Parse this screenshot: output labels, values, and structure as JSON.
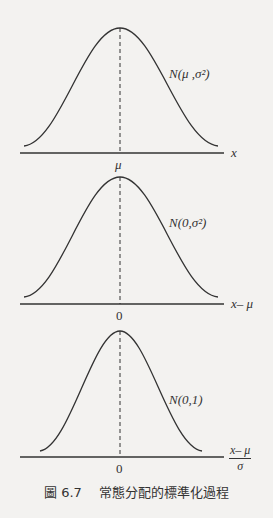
{
  "panels": [
    {
      "dist_label": "N(μ ,σ²)",
      "center_label": "μ",
      "axis_label": "x"
    },
    {
      "dist_label": "N(0,σ²)",
      "center_label": "0",
      "axis_label": "x– μ"
    },
    {
      "dist_label": "N(0,1)",
      "center_label": "0",
      "axis_label_num": "x– μ",
      "axis_label_den": "σ"
    }
  ],
  "caption": "圖 6.7　 常態分配的標準化過程",
  "colors": {
    "ink": "#333333",
    "paper": "#f3f2f0"
  }
}
